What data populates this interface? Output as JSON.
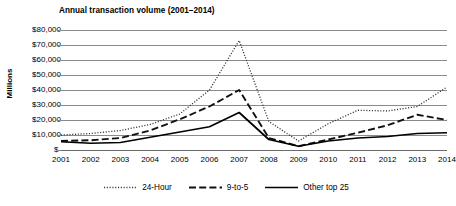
{
  "chart_data": {
    "type": "line",
    "title": "Annual transaction volume (2001–2014)",
    "xlabel": "",
    "ylabel": "Millions",
    "ylim": [
      0,
      80000
    ],
    "ytick_values": [
      80000,
      70000,
      60000,
      50000,
      40000,
      30000,
      20000,
      10000,
      0
    ],
    "ytick_labels": [
      "$80,000",
      "$70,000",
      "$60,000",
      "$50,000",
      "$40,000",
      "$30,000",
      "$20,000",
      "$10,000",
      "$-"
    ],
    "grid": true,
    "legend_position": "bottom",
    "categories": [
      "2001",
      "2002",
      "2003",
      "2004",
      "2005",
      "2006",
      "2007",
      "2008",
      "2009",
      "2010",
      "2011",
      "2012",
      "2013",
      "2014"
    ],
    "x": [
      2001,
      2002,
      2003,
      2004,
      2005,
      2006,
      2007,
      2008,
      2009,
      2010,
      2011,
      2012,
      2013,
      2014
    ],
    "series": [
      {
        "name": "24-Hour",
        "style": "dotted",
        "color": "#333333",
        "values": [
          10000,
          11000,
          13000,
          17000,
          24000,
          40000,
          73000,
          19000,
          6000,
          17500,
          26500,
          26000,
          29000,
          42000
        ]
      },
      {
        "name": "9-to-5",
        "style": "dashed",
        "color": "#111111",
        "values": [
          6000,
          6500,
          8000,
          13000,
          20500,
          29000,
          40000,
          8000,
          2500,
          7000,
          11500,
          16500,
          23500,
          20000
        ]
      },
      {
        "name": "Other top 25",
        "style": "solid",
        "color": "#000000",
        "values": [
          5500,
          4500,
          5000,
          8500,
          12000,
          15500,
          25000,
          7000,
          2500,
          6000,
          8000,
          9000,
          11000,
          11500
        ]
      }
    ]
  },
  "legend": {
    "entries": [
      {
        "label": "24-Hour",
        "style": "dotted"
      },
      {
        "label": "9-to-5",
        "style": "dashed"
      },
      {
        "label": "Other top 25",
        "style": "solid"
      }
    ]
  }
}
